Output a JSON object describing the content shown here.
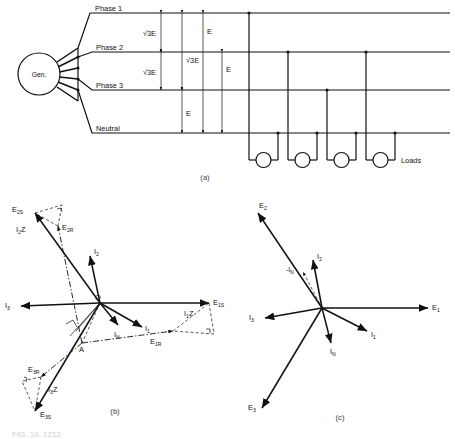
{
  "figure": {
    "caption_a": "(a)",
    "caption_b": "(b)",
    "caption_c": "(c)",
    "bottom_caption": "FIG. 10. 1212"
  },
  "diagram_a": {
    "name": "three-phase-four-wire-distribution-schematic",
    "generator_label": "Gen.",
    "lines": [
      {
        "label": "Phase 1"
      },
      {
        "label": "Phase 2"
      },
      {
        "label": "Phase 3"
      },
      {
        "label": "Neutral"
      }
    ],
    "loads_label": "Loads",
    "load_count": 4,
    "dimensions": [
      {
        "label": "√3E",
        "between": "Phase 1 - Phase 2"
      },
      {
        "label": "√3E",
        "between": "Phase 2 - Phase 3"
      },
      {
        "label": "√3E",
        "between": "Phase 1 - Phase 3"
      },
      {
        "label": "E",
        "between": "Phase 3 - Neutral"
      },
      {
        "label": "E",
        "between": "Phase 1 - Neutral"
      },
      {
        "label": "E",
        "between": "Phase 2 - Neutral"
      }
    ]
  },
  "diagram_b": {
    "name": "phasor-diagram-with-impedance-drops",
    "origin_label": "O",
    "point_a_label": "A",
    "vectors": [
      {
        "label": "E",
        "sub": "1S"
      },
      {
        "label": "E",
        "sub": "1R"
      },
      {
        "label": "E",
        "sub": "2S"
      },
      {
        "label": "E",
        "sub": "2R"
      },
      {
        "label": "E",
        "sub": "3S"
      },
      {
        "label": "E",
        "sub": "3R"
      },
      {
        "label": "I",
        "sub": "1"
      },
      {
        "label": "I",
        "sub": "2"
      },
      {
        "label": "I",
        "sub": "3"
      },
      {
        "label": "I",
        "sub": "N"
      }
    ],
    "drops": [
      {
        "label": "I",
        "sub": "1",
        "suffix": "Z"
      },
      {
        "label": "I",
        "sub": "2",
        "suffix": "Z"
      },
      {
        "label": "I",
        "sub": "3",
        "suffix": "Z"
      }
    ]
  },
  "diagram_c": {
    "name": "phasor-diagram-balanced-currents",
    "vectors": [
      {
        "label": "E",
        "sub": "1"
      },
      {
        "label": "E",
        "sub": "2"
      },
      {
        "label": "E",
        "sub": "3"
      },
      {
        "label": "I",
        "sub": "1"
      },
      {
        "label": "I",
        "sub": "2"
      },
      {
        "label": "I",
        "sub": "3"
      },
      {
        "label": "I",
        "sub": "N"
      },
      {
        "label": "-I",
        "sub": "N"
      }
    ]
  },
  "colors": {
    "stroke": "#111111",
    "background": "#ffffff",
    "caption": "#3a3a3a"
  }
}
